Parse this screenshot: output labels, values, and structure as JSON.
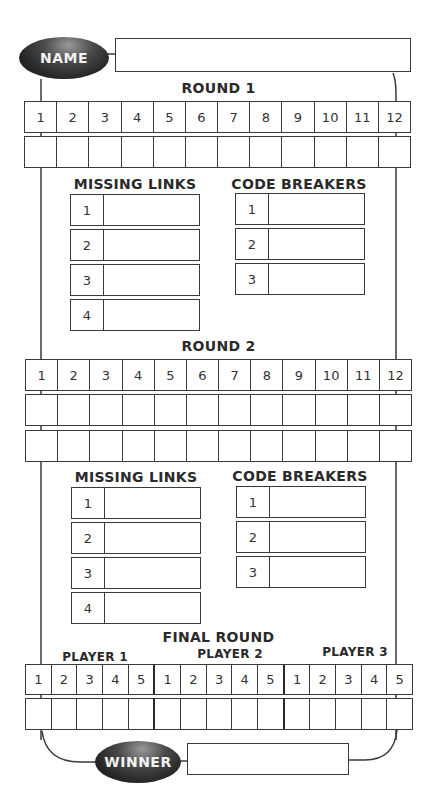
{
  "header": {
    "name_label": "NAME",
    "name_value": ""
  },
  "round1": {
    "title": "ROUND 1",
    "columns": [
      "1",
      "2",
      "3",
      "4",
      "5",
      "6",
      "7",
      "8",
      "9",
      "10",
      "11",
      "12"
    ],
    "answer_rows": 1,
    "missing_links": {
      "title": "MISSING LINKS",
      "items": [
        "1",
        "2",
        "3",
        "4"
      ]
    },
    "code_breakers": {
      "title": "CODE BREAKERS",
      "items": [
        "1",
        "2",
        "3"
      ]
    }
  },
  "round2": {
    "title": "ROUND 2",
    "columns": [
      "1",
      "2",
      "3",
      "4",
      "5",
      "6",
      "7",
      "8",
      "9",
      "10",
      "11",
      "12"
    ],
    "answer_rows": 2,
    "missing_links": {
      "title": "MISSING LINKS",
      "items": [
        "1",
        "2",
        "3",
        "4"
      ]
    },
    "code_breakers": {
      "title": "CODE BREAKERS",
      "items": [
        "1",
        "2",
        "3"
      ]
    }
  },
  "final_round": {
    "title": "FINAL ROUND",
    "players": [
      {
        "label": "PLAYER 1",
        "columns": [
          "1",
          "2",
          "3",
          "4",
          "5"
        ]
      },
      {
        "label": "PLAYER 2",
        "columns": [
          "1",
          "2",
          "3",
          "4",
          "5"
        ]
      },
      {
        "label": "PLAYER 3",
        "columns": [
          "1",
          "2",
          "3",
          "4",
          "5"
        ]
      }
    ]
  },
  "footer": {
    "winner_label": "WINNER",
    "winner_value": ""
  },
  "colors": {
    "line": "#3a3a3a",
    "oval_dark": "#1a1a1a",
    "oval_text": "#f2f2f2"
  }
}
